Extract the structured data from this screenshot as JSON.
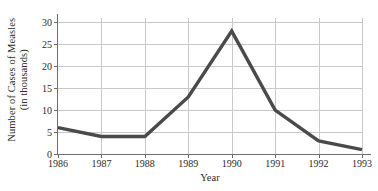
{
  "chart_data": {
    "type": "line",
    "title": "",
    "xlabel": "Year",
    "ylabel": "Number of Cases of Measles (in thousands)",
    "ylabel_line1": "Number of Cases of Measles",
    "ylabel_line2": "(in thousands)",
    "categories": [
      "1986",
      "1987",
      "1988",
      "1989",
      "1990",
      "1991",
      "1992",
      "1993"
    ],
    "x": [
      1986,
      1987,
      1988,
      1989,
      1990,
      1991,
      1992,
      1993
    ],
    "values": [
      6,
      4,
      4,
      13,
      28,
      10,
      3,
      1
    ],
    "series": [
      {
        "name": "Cases of Measles",
        "values": [
          6,
          4,
          4,
          13,
          28,
          10,
          3,
          1
        ]
      }
    ],
    "xlim": [
      1986,
      1993
    ],
    "ylim": [
      0,
      31
    ],
    "yticks": [
      0,
      5,
      10,
      15,
      20,
      25,
      30
    ],
    "ytick_labels": [
      "0",
      "5",
      "10",
      "15",
      "20",
      "25",
      "30"
    ],
    "xticks": [
      1986,
      1987,
      1988,
      1989,
      1990,
      1991,
      1992,
      1993
    ],
    "xtick_labels": [
      "1986",
      "1987",
      "1988",
      "1989",
      "1990",
      "1991",
      "1992",
      "1993"
    ],
    "grid": true,
    "grid_horizontal": true,
    "grid_vertical": true,
    "legend": false,
    "legend_position": "none",
    "annotations": []
  },
  "style": {
    "line_color": "#4a4a4a",
    "line_width": 3.4,
    "grid_color": "#c9c9c9",
    "axis_color": "#6e6e6e",
    "background": "#ffffff",
    "text_color": "#2b2b2b"
  }
}
